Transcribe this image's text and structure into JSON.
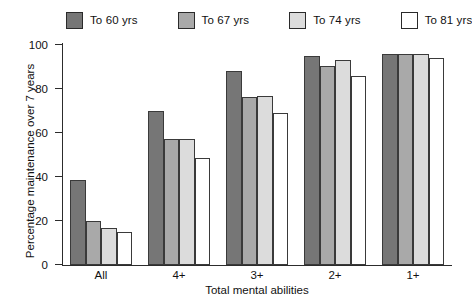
{
  "legend": {
    "items": [
      {
        "label": "To 60 yrs",
        "color": "#767676"
      },
      {
        "label": "To 67 yrs",
        "color": "#a9a9a9"
      },
      {
        "label": "To 74 yrs",
        "color": "#dcdcdc"
      },
      {
        "label": "To 81 yrs",
        "color": "#ffffff"
      }
    ]
  },
  "axes": {
    "y_title": "Percentage maintenance over 7 years",
    "x_title": "Total mental abilities",
    "y_ticks": [
      "0",
      "20",
      "40",
      "60",
      "80",
      "100"
    ],
    "x_ticks": [
      "All",
      "4+",
      "3+",
      "2+",
      "1+"
    ]
  },
  "chart_data": {
    "type": "bar",
    "title": "",
    "xlabel": "Total mental abilities",
    "ylabel": "Percentage maintenance over 7 years",
    "categories": [
      "All",
      "4+",
      "3+",
      "2+",
      "1+"
    ],
    "ylim": [
      0,
      100
    ],
    "yticks": [
      0,
      20,
      40,
      60,
      80,
      100
    ],
    "grid": false,
    "legend_position": "top",
    "series": [
      {
        "name": "To 60 yrs",
        "color": "#767676",
        "values": [
          38.5,
          70.0,
          88.0,
          95.0,
          96.0
        ]
      },
      {
        "name": "To 67 yrs",
        "color": "#a9a9a9",
        "values": [
          20.0,
          57.5,
          76.5,
          90.5,
          96.0
        ]
      },
      {
        "name": "To 74 yrs",
        "color": "#dcdcdc",
        "values": [
          17.0,
          57.5,
          77.0,
          93.0,
          96.0
        ]
      },
      {
        "name": "To 81 yrs",
        "color": "#ffffff",
        "values": [
          15.0,
          48.5,
          69.0,
          86.0,
          94.0
        ]
      }
    ]
  }
}
